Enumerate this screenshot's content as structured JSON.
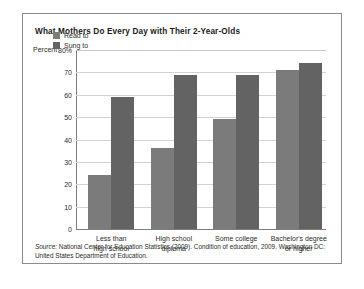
{
  "figure": {
    "title": "What Mothers Do Every Day with Their 2-Year-Olds",
    "source_word": "Source:",
    "source_text": " National Center for Education Statistics (2009). Condition of education, 2009. Washington DC: United States Department of Education."
  },
  "chart_data": {
    "type": "bar",
    "title": "What Mothers Do Every Day with Their 2-Year-Olds",
    "categories": [
      "Less than high school",
      "High school diploma",
      "Some college",
      "Bachelor's degree or higher"
    ],
    "category_lines": [
      [
        "Less than",
        "high school"
      ],
      [
        "High school",
        "diploma"
      ],
      [
        "Some college",
        ""
      ],
      [
        "Bachelor's degree",
        "or higher"
      ]
    ],
    "series": [
      {
        "name": "Read to",
        "color": "#7b7b7b",
        "values": [
          24,
          36,
          49,
          71
        ]
      },
      {
        "name": "Sung to",
        "color": "#636363",
        "values": [
          59,
          69,
          69,
          74
        ]
      }
    ],
    "axis_label": "Percent",
    "xlabel": "",
    "ylabel": "Percent",
    "ylim": [
      0,
      80
    ],
    "ytick_labels": [
      "80%",
      "70",
      "60",
      "50",
      "40",
      "30",
      "20",
      "10",
      "0"
    ],
    "ytick_values": [
      80,
      70,
      60,
      50,
      40,
      30,
      20,
      10,
      0
    ],
    "grid": true,
    "legend_position": "top-left-inside"
  }
}
